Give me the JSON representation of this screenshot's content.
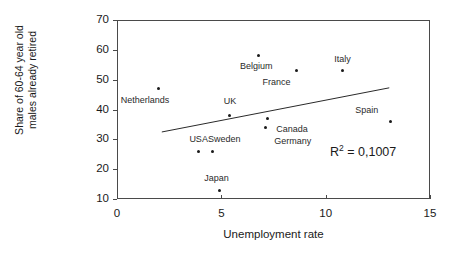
{
  "chart_data": {
    "type": "scatter",
    "title": "",
    "xlabel": "Unemployment rate",
    "ylabel_line1": "Share of 60-64 year old",
    "ylabel_line2": "males already retired",
    "xlim": [
      0,
      15
    ],
    "ylim": [
      10,
      70
    ],
    "xticks": [
      0,
      5,
      10,
      15
    ],
    "yticks": [
      10,
      20,
      30,
      40,
      50,
      60,
      70
    ],
    "xtick_labels": [
      "0",
      "5",
      "10",
      "15"
    ],
    "ytick_labels": [
      "10",
      "20",
      "30",
      "40",
      "50",
      "60",
      "70"
    ],
    "grid": false,
    "legend": "none",
    "annotations": [
      {
        "name": "r-squared",
        "prefix": "R",
        "superscript": "2",
        "suffix": " = 0,1007",
        "full_text": "R2 = 0,1007"
      }
    ],
    "points": [
      {
        "label": "Netherlands",
        "x": 2.0,
        "y": 47,
        "label_dx": -38,
        "label_dy": 11
      },
      {
        "label": "UK",
        "x": 5.4,
        "y": 38,
        "label_dx": -6,
        "label_dy": -14
      },
      {
        "label": "Belgium",
        "x": 6.8,
        "y": 58,
        "label_dx": -19,
        "label_dy": 10
      },
      {
        "label": "France",
        "x": 8.6,
        "y": 53,
        "label_dx": -34,
        "label_dy": 11
      },
      {
        "label": "Italy",
        "x": 10.8,
        "y": 53,
        "label_dx": -8,
        "label_dy": -12
      },
      {
        "label": "Spain",
        "x": 13.1,
        "y": 36,
        "label_dx": -35,
        "label_dy": -11
      },
      {
        "label": "Canada",
        "x": 7.2,
        "y": 37,
        "label_dx": 9,
        "label_dy": 11
      },
      {
        "label": "Germany",
        "x": 7.1,
        "y": 34,
        "label_dx": 9,
        "label_dy": 14
      },
      {
        "label": "USA",
        "x": 3.9,
        "y": 26,
        "label_dx": -9,
        "label_dy": -12
      },
      {
        "label": "Sweden",
        "x": 4.6,
        "y": 26,
        "label_dx": -5,
        "label_dy": -12
      },
      {
        "label": "Japan",
        "x": 4.9,
        "y": 13,
        "label_dx": -15,
        "label_dy": -12
      }
    ],
    "trendline": {
      "name": "linear-trendline",
      "x_start": 2.1,
      "y_start": 32.8,
      "x_end": 13.0,
      "y_end": 47.6,
      "r_squared": 0.1007
    }
  }
}
